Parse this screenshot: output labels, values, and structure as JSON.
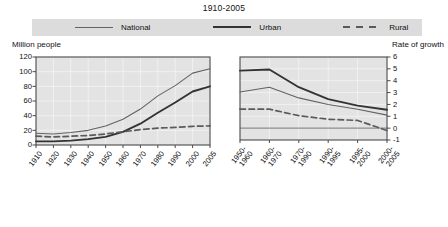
{
  "title": "1910-2005",
  "legend": {
    "items": [
      {
        "label": "National",
        "style": "thin",
        "color": "#636363"
      },
      {
        "label": "Urban",
        "style": "thick",
        "color": "#333333"
      },
      {
        "label": "Rural",
        "style": "dashed",
        "color": "#5a5a5a"
      }
    ]
  },
  "left_panel": {
    "axis_caption": "Million people",
    "y_ticks": [
      "0",
      "20",
      "40",
      "60",
      "80",
      "100",
      "120"
    ],
    "x_ticks": [
      "1910",
      "1920",
      "1930",
      "1940",
      "1950",
      "1960",
      "1970",
      "1980",
      "1990",
      "2000",
      "2005"
    ]
  },
  "right_panel": {
    "axis_caption": "Rate of growth",
    "y_ticks": [
      "-1",
      "0",
      "1",
      "2",
      "3",
      "4",
      "5",
      "6"
    ],
    "x_ticks": [
      "1950-\n1960",
      "1960-\n1970",
      "1970-\n1990",
      "1990-\n1995",
      "1995-\n2000",
      "2000-\n2005"
    ]
  },
  "chart_data": [
    {
      "type": "line",
      "title": "1910-2005",
      "subtitle": "Population by residence",
      "xlabel": "",
      "ylabel": "Million people",
      "ylim": [
        0,
        120
      ],
      "ytick_step": 20,
      "grid": true,
      "legend_position": "top",
      "categories": [
        "1910",
        "1920",
        "1930",
        "1940",
        "1950",
        "1960",
        "1970",
        "1980",
        "1990",
        "2000",
        "2005"
      ],
      "series": [
        {
          "name": "National",
          "style": "thin",
          "values": [
            16.0,
            15.0,
            17.0,
            20.0,
            26.0,
            35.0,
            49.0,
            67.0,
            81.0,
            98.0,
            104.0
          ]
        },
        {
          "name": "Urban",
          "style": "thick",
          "values": [
            5.0,
            5.0,
            6.0,
            8.0,
            11.0,
            18.0,
            29.0,
            44.0,
            58.0,
            73.0,
            80.0
          ]
        },
        {
          "name": "Rural",
          "style": "dashed",
          "values": [
            12.0,
            11.0,
            12.0,
            13.0,
            15.0,
            18.0,
            21.0,
            23.0,
            24.0,
            25.5,
            26.0
          ]
        }
      ]
    },
    {
      "type": "line",
      "title": "1910-2005",
      "subtitle": "Rate of growth by residence",
      "xlabel": "",
      "ylabel": "Rate of growth",
      "ylim": [
        -1,
        6
      ],
      "ytick_step": 1,
      "grid": true,
      "legend_position": "top",
      "categories": [
        "1950-1960",
        "1960-1970",
        "1970-1990",
        "1990-1995",
        "1995-2000",
        "2000-2005"
      ],
      "series": [
        {
          "name": "National",
          "style": "thin",
          "values": [
            3.05,
            3.45,
            2.55,
            2.0,
            1.6,
            1.1
          ]
        },
        {
          "name": "Urban",
          "style": "thick",
          "values": [
            4.85,
            4.95,
            3.45,
            2.45,
            1.9,
            1.55
          ]
        },
        {
          "name": "Rural",
          "style": "dashed",
          "values": [
            1.6,
            1.6,
            1.05,
            0.75,
            0.65,
            -0.2
          ]
        }
      ]
    }
  ]
}
